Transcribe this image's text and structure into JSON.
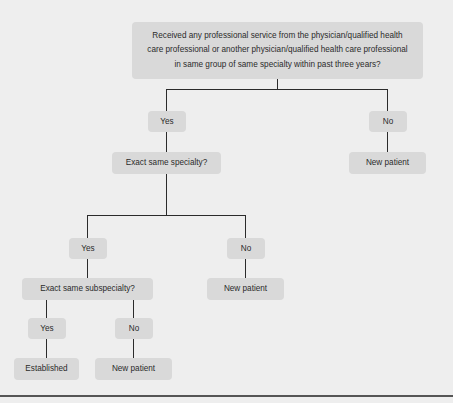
{
  "diagram": {
    "colors": {
      "background": "#eeeeee",
      "node_fill": "#d9d9d9",
      "text": "#2b2b2b",
      "connector": "#2b2b2b",
      "rule": "#555555"
    },
    "nodes": {
      "root_question": "Received any professional service from the physician/qualified health care professional or another physician/qualified health care professional in same group of same specialty within past three years?",
      "root_question_lines": [
        "Received any professional service from the physician/qualified health",
        "care professional or another physician/qualified health care professional",
        "in same group of same specialty within past three years?"
      ],
      "level1_yes": "Yes",
      "level1_no": "No",
      "level1_no_outcome": "New patient",
      "specialty_question": "Exact same specialty?",
      "level2_yes": "Yes",
      "level2_no": "No",
      "level2_no_outcome": "New patient",
      "subspecialty_question": "Exact same subspecialty?",
      "level3_yes": "Yes",
      "level3_no": "No",
      "level3_yes_outcome": "Established",
      "level3_no_outcome": "New patient"
    }
  }
}
